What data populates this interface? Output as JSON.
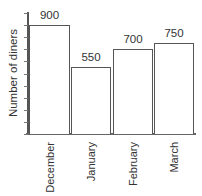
{
  "chart_data": {
    "type": "bar",
    "title": "",
    "xlabel": "",
    "ylabel": "Number of diners",
    "categories": [
      "December",
      "January",
      "February",
      "March"
    ],
    "values": [
      900,
      550,
      700,
      750
    ],
    "data_labels": [
      "900",
      "550",
      "700",
      "750"
    ],
    "ylim": [
      0,
      1000
    ],
    "ytick_count": 10,
    "ytick_labels_shown": false,
    "grid": false,
    "legend": null,
    "bar_fill": "#ffffff",
    "bar_edge": "#555555"
  }
}
